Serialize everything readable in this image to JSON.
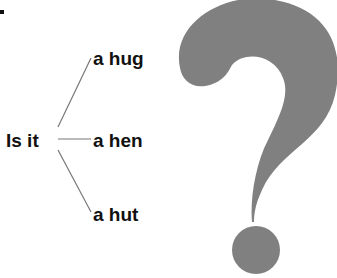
{
  "diagram": {
    "root": "Is it",
    "branches": [
      "a hug",
      "a hen",
      "a hut"
    ],
    "colors": {
      "question_mark": "#808080",
      "text": "#111111",
      "lines": "#777777"
    }
  }
}
